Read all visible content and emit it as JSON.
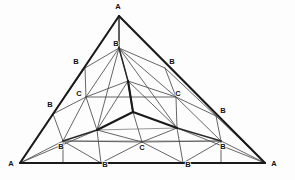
{
  "figure": {
    "width": 295,
    "height": 180,
    "background_color": "#fdfdfd",
    "line_color": "#1a1a1a",
    "label_color": "#111111"
  },
  "labels": [
    {
      "id": "apex-a",
      "text": "A",
      "x": 118,
      "y": 7
    },
    {
      "id": "bottom-left-a",
      "text": "A",
      "x": 11,
      "y": 164
    },
    {
      "id": "bottom-right-a",
      "text": "A",
      "x": 274,
      "y": 164
    },
    {
      "id": "top-center-b",
      "text": "B",
      "x": 116,
      "y": 44
    },
    {
      "id": "upper-left-b",
      "text": "B",
      "x": 76,
      "y": 62
    },
    {
      "id": "upper-right-b",
      "text": "B",
      "x": 172,
      "y": 62
    },
    {
      "id": "lower-left-b",
      "text": "B",
      "x": 50,
      "y": 105
    },
    {
      "id": "lower-right-b",
      "text": "B",
      "x": 223,
      "y": 111
    },
    {
      "id": "inner-left-b",
      "text": "B",
      "x": 61,
      "y": 147
    },
    {
      "id": "inner-right-b",
      "text": "B",
      "x": 223,
      "y": 147
    },
    {
      "id": "base-left-b",
      "text": "B",
      "x": 105,
      "y": 165
    },
    {
      "id": "base-right-b",
      "text": "B",
      "x": 188,
      "y": 165
    },
    {
      "id": "left-c",
      "text": "C",
      "x": 79,
      "y": 94
    },
    {
      "id": "right-c",
      "text": "C",
      "x": 178,
      "y": 94
    },
    {
      "id": "center-c",
      "text": "C",
      "x": 142,
      "y": 148
    }
  ],
  "vertices": {
    "apex": {
      "x": 119,
      "y": 16
    },
    "base_left": {
      "x": 20,
      "y": 163
    },
    "base_right": {
      "x": 265,
      "y": 163
    },
    "left_mid1": {
      "x": 85,
      "y": 68
    },
    "left_mid2": {
      "x": 53,
      "y": 114
    },
    "right_mid1": {
      "x": 165,
      "y": 68
    },
    "right_mid2": {
      "x": 216,
      "y": 116
    },
    "base_mid1": {
      "x": 101,
      "y": 163
    },
    "base_mid2": {
      "x": 183,
      "y": 163
    },
    "inner_left": {
      "x": 63,
      "y": 141
    },
    "inner_right": {
      "x": 221,
      "y": 141
    },
    "top_b_node": {
      "x": 119,
      "y": 48
    },
    "cube_top": {
      "x": 128,
      "y": 81
    },
    "cube_center": {
      "x": 133,
      "y": 112
    },
    "cube_left": {
      "x": 97,
      "y": 130
    },
    "cube_right": {
      "x": 177,
      "y": 128
    },
    "left_c_node": {
      "x": 86,
      "y": 97
    },
    "right_c_node": {
      "x": 176,
      "y": 97
    },
    "base_c_node": {
      "x": 142,
      "y": 142
    }
  },
  "edges": {
    "outer_triangle": [
      "apex->base_left",
      "base_left->base_right",
      "base_right->apex"
    ],
    "inner_cube": [
      "cube_center->cube_top",
      "cube_center->cube_left",
      "cube_center->cube_right"
    ],
    "count_labels_a": 3,
    "count_labels_b": 9,
    "count_labels_c": 3
  }
}
